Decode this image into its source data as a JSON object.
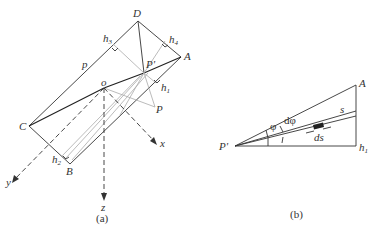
{
  "figure_a": {
    "caption": "(a)",
    "labels": {
      "D": "D",
      "A": "A",
      "C": "C",
      "B": "B",
      "P_prime": "P'",
      "P": "P",
      "o": "o",
      "p": "p",
      "h1": "h",
      "h1_sub": "1",
      "h2": "h",
      "h2_sub": "2",
      "h3": "h",
      "h3_sub": "3",
      "h4": "h",
      "h4_sub": "4",
      "x": "x",
      "y": "y",
      "z": "z"
    }
  },
  "figure_b": {
    "caption": "(b)",
    "labels": {
      "A": "A",
      "P_prime": "P'",
      "h1": "h",
      "h1_sub": "1",
      "s": "s",
      "phi": "φ",
      "dphi": "dφ",
      "ds": "ds"
    }
  }
}
